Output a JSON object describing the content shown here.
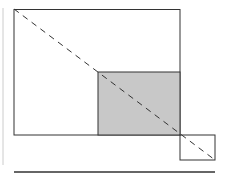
{
  "diagram": {
    "colors": {
      "stroke": "#333333",
      "fill_shaded": "#c8c8c8",
      "left_rule": "#cccccc",
      "background": "#ffffff"
    },
    "shapes": {
      "large_rect": {
        "x": 14,
        "y": 9,
        "w": 166,
        "h": 126
      },
      "shaded_rect": {
        "x": 98,
        "y": 72,
        "w": 82,
        "h": 63
      },
      "small_rect": {
        "x": 180,
        "y": 135,
        "w": 35,
        "h": 25
      },
      "diagonal": {
        "x1": 14,
        "y1": 9,
        "x2": 215,
        "y2": 160
      },
      "bottom_rule": {
        "x1": 14,
        "y1": 172,
        "x2": 215,
        "y2": 172
      },
      "left_rule": {
        "x1": 3,
        "y1": 8,
        "x2": 3,
        "y2": 165
      }
    }
  }
}
